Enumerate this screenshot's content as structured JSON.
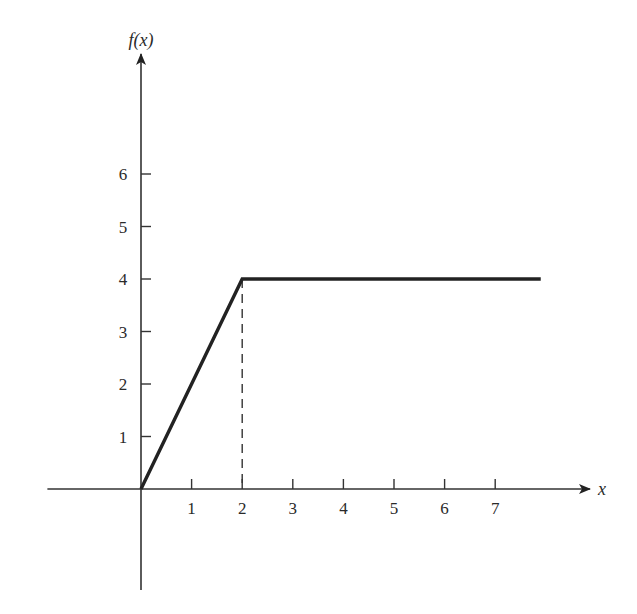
{
  "chart_data": {
    "type": "line",
    "title": "",
    "xlabel": "x",
    "ylabel": "f(x)",
    "xlim": [
      -1.85,
      8.9
    ],
    "ylim": [
      -1.95,
      8.3
    ],
    "x_ticks": [
      1,
      2,
      3,
      4,
      5,
      6,
      7
    ],
    "x_tick_labels": [
      "1",
      "2",
      "3",
      "4",
      "5",
      "6",
      "7"
    ],
    "y_ticks": [
      1,
      2,
      3,
      4,
      5,
      6
    ],
    "y_tick_labels": [
      "1",
      "2",
      "3",
      "4",
      "5",
      "6"
    ],
    "grid": false,
    "legend": "none",
    "series": [
      {
        "name": "f(x)",
        "x": [
          0,
          2,
          7.9
        ],
        "y": [
          0,
          4,
          4
        ],
        "style": "solid-thick"
      }
    ],
    "annotations": [
      {
        "type": "dashed-vertical",
        "x": 2,
        "y_from": 0,
        "y_to": 4
      }
    ],
    "colors": {
      "line": "#222222",
      "axis": "#333333",
      "text": "#2a2a2a"
    }
  }
}
